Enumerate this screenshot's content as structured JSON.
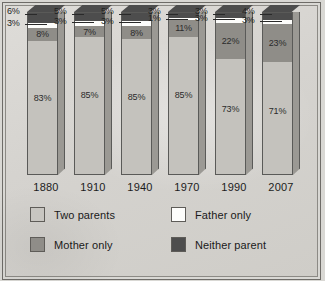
{
  "chart_data": {
    "type": "bar",
    "subtype": "stacked-percent-100",
    "title": "",
    "subtitle": "",
    "xlabel": "",
    "ylabel": "",
    "ylim": [
      0,
      100
    ],
    "grid": false,
    "legend_position": "bottom",
    "categories": [
      "1880",
      "1910",
      "1940",
      "1970",
      "1990",
      "2007"
    ],
    "series": [
      {
        "name": "Two parents",
        "color": "#c4c2bd",
        "values": [
          83,
          85,
          85,
          85,
          73,
          71
        ],
        "labels": [
          "83%",
          "85%",
          "85%",
          "85%",
          "73%",
          "71%"
        ]
      },
      {
        "name": "Mother only",
        "color": "#8f8d88",
        "values": [
          8,
          7,
          8,
          11,
          22,
          23
        ],
        "labels": [
          "8%",
          "7%",
          "8%",
          "11%",
          "22%",
          "23%"
        ]
      },
      {
        "name": "Father only",
        "color": "#fdfdfb",
        "values": [
          3,
          3,
          3,
          1,
          3,
          3
        ],
        "labels": [
          "3%",
          "3%",
          "3%",
          "1%",
          "3%",
          "3%"
        ]
      },
      {
        "name": "Neither parent",
        "color": "#4d4d4d",
        "values": [
          6,
          5,
          5,
          3,
          3,
          4
        ],
        "labels": [
          "6%",
          "5%",
          "5%",
          "3%",
          "3%",
          "4%"
        ]
      }
    ]
  },
  "legend": {
    "items": [
      {
        "label": "Two parents",
        "swatch": "two-parents-swatch"
      },
      {
        "label": "Father only",
        "swatch": "father-only-swatch"
      },
      {
        "label": "Mother only",
        "swatch": "mother-only-swatch"
      },
      {
        "label": "Neither parent",
        "swatch": "neither-parent-swatch"
      }
    ]
  },
  "colors": {
    "panel_background": "#d5d3cf",
    "frame_border": "#6e6c68",
    "two_parents": "#c4c2bd",
    "mother_only": "#8f8d88",
    "father_only": "#fdfdfb",
    "neither_parent": "#4d4d4d",
    "text": "#1a1a1a"
  },
  "artifact": {
    "bottom_smudge": ""
  }
}
